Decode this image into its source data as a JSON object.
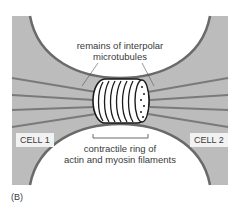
{
  "figure": {
    "panel_label": "(B)",
    "labels": {
      "microtubules_line1": "remains of interpolar",
      "microtubules_line2": "microtubules",
      "ring_line1": "contractile ring of",
      "ring_line2": "actin and myosin filaments",
      "cell1": "CELL 1",
      "cell2": "CELL 2"
    },
    "colors": {
      "background_grey": "#bcbcbc",
      "membrane": "#6a6a6a",
      "cell_interior": "#ffffff",
      "microtubule": "#7a7a7a",
      "ring_outline": "#1a1a1a"
    }
  }
}
